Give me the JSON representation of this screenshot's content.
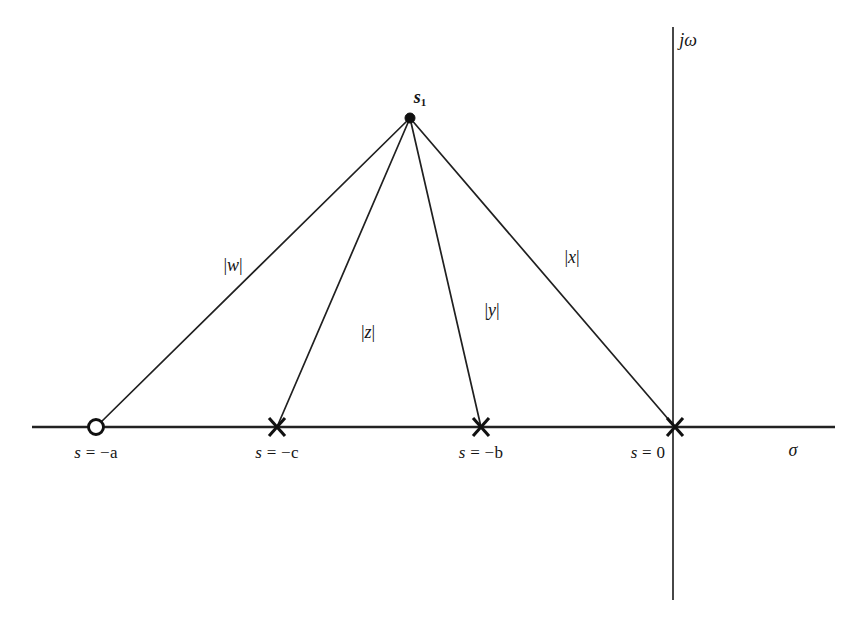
{
  "figure": {
    "background_color": "#ffffff",
    "ink_color": "#151515"
  },
  "axes": {
    "real": {
      "name": "sigma-axis",
      "label": "σ",
      "label_x": 793,
      "label_y": 450,
      "y": 427,
      "x_start": 32,
      "x_end": 835
    },
    "imaginary": {
      "name": "j-omega-axis",
      "label": "jω",
      "label_x": 688,
      "label_y": 40,
      "x": 673,
      "y_start": 27,
      "y_end": 600
    }
  },
  "test_point": {
    "label": "s",
    "subscript": "1",
    "x": 410,
    "y": 118,
    "label_x": 420,
    "label_y": 97,
    "marker": "filled-dot"
  },
  "singularities": [
    {
      "id": "zero-a",
      "kind": "zero",
      "marker": "open-circle",
      "label": "s = −a",
      "label_lead": "s",
      "label_rest": " = −a",
      "x": 96,
      "y": 427,
      "label_x": 96,
      "label_y": 452
    },
    {
      "id": "pole-c",
      "kind": "pole",
      "marker": "cross",
      "label": "s = −c",
      "label_lead": "s",
      "label_rest": " = −c",
      "x": 277,
      "y": 427,
      "label_x": 277,
      "label_y": 452
    },
    {
      "id": "pole-b",
      "kind": "pole",
      "marker": "cross",
      "label": "s = −b",
      "label_lead": "s",
      "label_rest": " = −b",
      "x": 481,
      "y": 427,
      "label_x": 481,
      "label_y": 452
    },
    {
      "id": "pole-origin",
      "kind": "pole",
      "marker": "cross",
      "label": "s = 0",
      "label_lead": "s",
      "label_rest": " = 0",
      "x": 675,
      "y": 427,
      "label_x": 648,
      "label_y": 452
    }
  ],
  "vectors": [
    {
      "id": "vector-w",
      "from_label": "s1",
      "to": "zero-a",
      "magnitude_label": "|w|",
      "mag_open": "|",
      "mag_var": "w",
      "mag_close": "|",
      "x1": 410,
      "y1": 118,
      "x2": 96,
      "y2": 427,
      "label_x": 233,
      "label_y": 265
    },
    {
      "id": "vector-z",
      "from_label": "s1",
      "to": "pole-c",
      "magnitude_label": "|z|",
      "mag_open": "|",
      "mag_var": "z",
      "mag_close": "|",
      "x1": 410,
      "y1": 118,
      "x2": 277,
      "y2": 427,
      "label_x": 368,
      "label_y": 332
    },
    {
      "id": "vector-y",
      "from_label": "s1",
      "to": "pole-b",
      "magnitude_label": "|y|",
      "mag_open": "|",
      "mag_var": "y",
      "mag_close": "|",
      "x1": 410,
      "y1": 118,
      "x2": 481,
      "y2": 427,
      "label_x": 492,
      "label_y": 310
    },
    {
      "id": "vector-x",
      "from_label": "s1",
      "to": "pole-origin",
      "magnitude_label": "|x|",
      "mag_open": "|",
      "mag_var": "x",
      "mag_close": "|",
      "x1": 410,
      "y1": 118,
      "x2": 675,
      "y2": 427,
      "label_x": 572,
      "label_y": 257
    }
  ]
}
